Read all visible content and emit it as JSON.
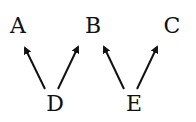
{
  "diagram": {
    "nodes": [
      {
        "id": "A",
        "label": "A"
      },
      {
        "id": "B",
        "label": "B"
      },
      {
        "id": "C",
        "label": "C"
      },
      {
        "id": "D",
        "label": "D"
      },
      {
        "id": "E",
        "label": "E"
      }
    ],
    "edges": [
      {
        "from": "D",
        "to": "A"
      },
      {
        "from": "D",
        "to": "B"
      },
      {
        "from": "E",
        "to": "B"
      },
      {
        "from": "E",
        "to": "C"
      }
    ],
    "colors": {
      "ink": "#111111",
      "background": "#ffffff"
    }
  }
}
